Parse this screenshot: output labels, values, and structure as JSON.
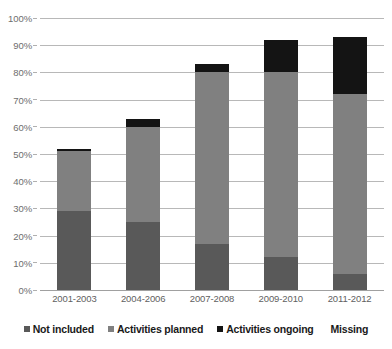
{
  "chart_data": {
    "type": "bar",
    "stacked": true,
    "title": "",
    "subtitle": "",
    "xlabel": "",
    "ylabel": "",
    "ylim": [
      0,
      100
    ],
    "ytick_labels": [
      "100%",
      "90%",
      "80%",
      "70%",
      "60%",
      "50%",
      "40%",
      "30%",
      "20%",
      "10%",
      "0%"
    ],
    "ytick_values": [
      100,
      90,
      80,
      70,
      60,
      50,
      40,
      30,
      20,
      10,
      0
    ],
    "grid": true,
    "legend_position": "bottom",
    "categories": [
      "2001-2003",
      "2004-2006",
      "2007-2008",
      "2009-2010",
      "2011-2012"
    ],
    "series": [
      {
        "name": "Not included",
        "color": "#595959",
        "values": [
          29,
          25,
          17,
          12,
          6
        ]
      },
      {
        "name": "Activities planned",
        "color": "#808080",
        "values": [
          22,
          35,
          63,
          68,
          66
        ]
      },
      {
        "name": "Activities ongoing",
        "color": "#141414",
        "values": [
          1,
          3,
          3,
          12,
          21
        ]
      },
      {
        "name": "Missing",
        "color": "#ffffff",
        "values": [
          48,
          37,
          17,
          8,
          7
        ]
      }
    ],
    "cumulative_tops": {
      "not_included": [
        29,
        25,
        17,
        12,
        6
      ],
      "planned": [
        51,
        60,
        80,
        80,
        72
      ],
      "ongoing": [
        52,
        63,
        83,
        92,
        93
      ],
      "missing": [
        100,
        100,
        100,
        100,
        100
      ]
    }
  },
  "legend": {
    "items": [
      {
        "label": "Not included",
        "color": "#595959",
        "has_swatch": true
      },
      {
        "label": "Activities planned",
        "color": "#808080",
        "has_swatch": true
      },
      {
        "label": "Activities ongoing",
        "color": "#141414",
        "has_swatch": true
      },
      {
        "label": "Missing",
        "color": "#ffffff",
        "has_swatch": false
      }
    ]
  }
}
